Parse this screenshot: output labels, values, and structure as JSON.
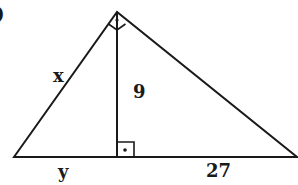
{
  "figure": {
    "problem_marker": ")",
    "type": "right triangle with altitude to hypotenuse",
    "labels": {
      "left_leg": "x",
      "altitude": "9",
      "left_segment": "y",
      "right_segment": "27"
    },
    "right_angle_marks": [
      "apex",
      "altitude-foot"
    ],
    "colors": {
      "stroke": "#1a1a1a",
      "background": "#ffffff"
    }
  }
}
